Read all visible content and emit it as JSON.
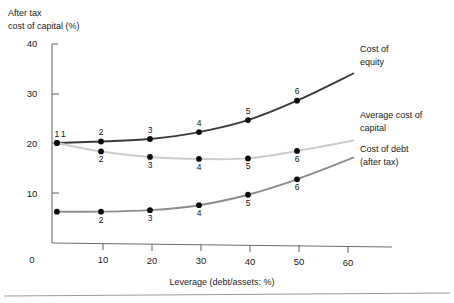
{
  "chart_data": {
    "type": "line",
    "title": "",
    "xlabel": "Leverage (debt/assets: %)",
    "ylabel": "After tax cost of capital (%)",
    "ylabel_line1": "After tax",
    "ylabel_line2": "cost of capital (%)",
    "xlim": [
      0,
      65
    ],
    "ylim": [
      0,
      40
    ],
    "xticks": [
      0,
      10,
      20,
      30,
      40,
      50,
      60
    ],
    "yticks": [
      0,
      10,
      20,
      30,
      40
    ],
    "xtick_labels": [
      "0",
      "10",
      "20",
      "30",
      "40",
      "50",
      "60"
    ],
    "ytick_labels": [
      "0",
      "10",
      "20",
      "30",
      "40"
    ],
    "grid": false,
    "legend_position": "right-inline-annotations",
    "x": [
      1,
      10,
      20,
      30,
      40,
      50
    ],
    "point_labels": [
      "1",
      "2",
      "3",
      "4",
      "5",
      "6"
    ],
    "series": [
      {
        "name": "Cost of equity",
        "label_line1": "Cost of",
        "label_line2": "equity",
        "color": "#3a3a3a",
        "values": [
          20.0,
          20.3,
          20.8,
          22.2,
          24.6,
          28.5
        ],
        "label_positions": [
          "above",
          "above",
          "above",
          "above",
          "above",
          "above"
        ]
      },
      {
        "name": "Average cost of capital",
        "label_line1": "Average cost of",
        "label_line2": "capital",
        "color": "#cccccc",
        "values": [
          20.0,
          18.3,
          17.2,
          16.8,
          16.9,
          18.4
        ],
        "label_positions": [
          "above",
          "below",
          "below",
          "below",
          "below",
          "below"
        ]
      },
      {
        "name": "Cost of debt (after tax)",
        "label_line1": "Cost of debt",
        "label_line2": "(after tax)",
        "color": "#8c8c8c",
        "values": [
          6.2,
          6.2,
          6.5,
          7.5,
          9.6,
          12.7
        ],
        "label_positions": [
          "none",
          "below",
          "below",
          "below",
          "below",
          "below"
        ]
      }
    ]
  },
  "colors": {
    "equity": "#3a3a3a",
    "average": "#cccccc",
    "debt": "#8c8c8c",
    "axis": "#6e6e6e",
    "text": "#1a1a1a",
    "background": "#ffffff"
  }
}
